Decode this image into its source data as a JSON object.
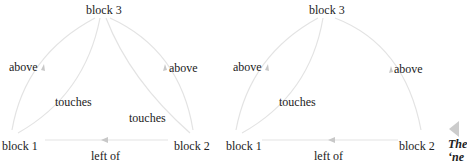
{
  "graphs": [
    {
      "nodes": {
        "b1": "block 1",
        "b2": "block 2",
        "b3": "block 3"
      },
      "edges": {
        "b1_b3_above": "above",
        "b1_b3_touches": "touches",
        "b2_b3_above": "above",
        "b2_b3_touches": "touches",
        "b2_b1_leftof": "left of"
      }
    },
    {
      "nodes": {
        "b1": "block 1",
        "b2": "block 2",
        "b3": "block 3"
      },
      "edges": {
        "b1_b3_above": "above",
        "b1_b3_touches": "touches",
        "b2_b3_above": "above",
        "b2_b1_leftof": "left of"
      }
    }
  ],
  "caption": {
    "line1": "The",
    "line2": "‘ne"
  },
  "colors": {
    "edge": "#e3e3e3",
    "arrow": "#c8c8c8",
    "text": "#222222"
  }
}
